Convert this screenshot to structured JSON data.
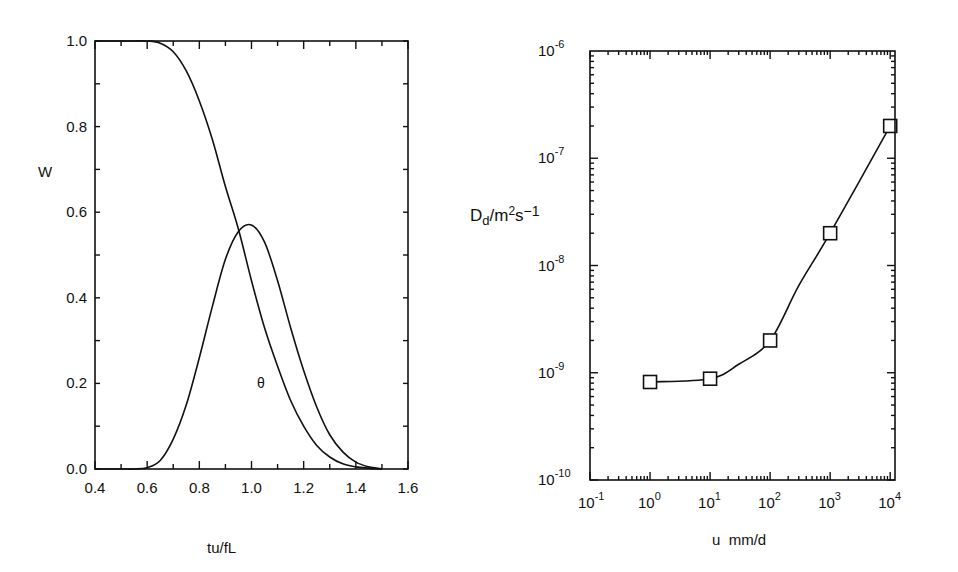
{
  "chart_data": [
    {
      "type": "line",
      "id": "left",
      "title": "",
      "xlabel": "tu/fL",
      "ylabel": "W",
      "xlim": [
        0.4,
        1.6
      ],
      "ylim": [
        0.0,
        1.0
      ],
      "xticks": [
        0.4,
        0.6,
        0.8,
        1.0,
        1.2,
        1.4,
        1.6
      ],
      "xtick_labels": [
        "0.4",
        "0.6",
        "0.8",
        "1.0",
        "1.2",
        "1.4",
        "1.6"
      ],
      "yticks": [
        0.0,
        0.2,
        0.4,
        0.6,
        0.8,
        1.0
      ],
      "ytick_labels": [
        "0.0",
        "0.2",
        "0.4",
        "0.6",
        "0.8",
        "1.0"
      ],
      "grid": false,
      "annotations": [
        {
          "text": "θ",
          "x": 1.04,
          "y": 0.2
        }
      ],
      "series": [
        {
          "name": "W",
          "x": [
            0.4,
            0.5,
            0.55,
            0.6,
            0.65,
            0.7,
            0.75,
            0.8,
            0.85,
            0.9,
            0.95,
            1.0,
            1.05,
            1.1,
            1.15,
            1.2,
            1.25,
            1.3,
            1.35,
            1.4,
            1.45,
            1.5
          ],
          "y": [
            1.0,
            1.0,
            1.0,
            1.0,
            0.995,
            0.975,
            0.93,
            0.86,
            0.77,
            0.66,
            0.56,
            0.44,
            0.33,
            0.24,
            0.16,
            0.1,
            0.055,
            0.028,
            0.012,
            0.005,
            0.002,
            0.0
          ]
        },
        {
          "name": "θ",
          "x": [
            0.4,
            0.5,
            0.55,
            0.6,
            0.65,
            0.7,
            0.75,
            0.8,
            0.85,
            0.9,
            0.95,
            1.0,
            1.05,
            1.1,
            1.15,
            1.2,
            1.25,
            1.3,
            1.35,
            1.4,
            1.45,
            1.5
          ],
          "y": [
            0.0,
            0.0,
            0.0,
            0.003,
            0.02,
            0.07,
            0.15,
            0.26,
            0.38,
            0.49,
            0.555,
            0.57,
            0.53,
            0.44,
            0.33,
            0.23,
            0.145,
            0.08,
            0.04,
            0.016,
            0.005,
            0.0
          ]
        }
      ]
    },
    {
      "type": "line",
      "id": "right",
      "title": "",
      "xlabel": "u  mm/d",
      "ylabel": "D_d/m^2s^-1",
      "xscale": "log",
      "yscale": "log",
      "xlim": [
        0.1,
        10000
      ],
      "ylim": [
        1e-10,
        1e-06
      ],
      "xtick_exponents": [
        "-1",
        "0",
        "1",
        "2",
        "3",
        "4"
      ],
      "ytick_exponents": [
        "-10",
        "-9",
        "-8",
        "-7",
        "-6"
      ],
      "grid": false,
      "marker": "open-square",
      "series": [
        {
          "name": "D_d",
          "x": [
            1,
            10,
            100,
            1000,
            10000
          ],
          "y": [
            8.2e-10,
            8.8e-10,
            2e-09,
            2e-08,
            2e-07
          ]
        }
      ]
    }
  ],
  "labels": {
    "left_ylabel": "W",
    "left_xlabel": "tu/fL",
    "theta": "θ",
    "right_ylabel_main": "D",
    "right_ylabel_sub": "d",
    "right_ylabel_rest": "/m",
    "right_ylabel_sup1": "2",
    "right_ylabel_s": "s",
    "right_ylabel_sup2": "−1",
    "right_xlabel": "u  mm/d"
  }
}
